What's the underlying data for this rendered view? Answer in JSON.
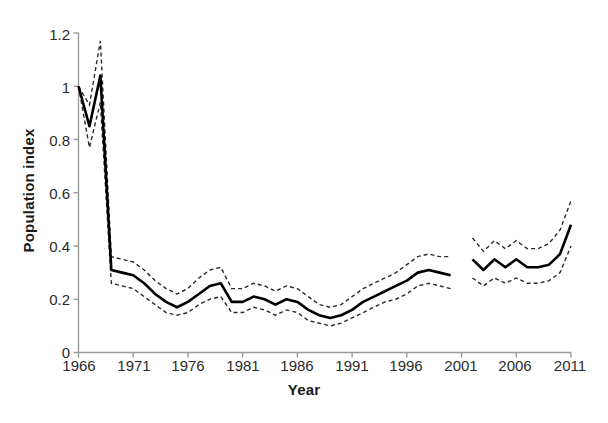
{
  "chart_data": {
    "type": "line",
    "title": "",
    "xlabel": "Year",
    "ylabel": "Population index",
    "xlim": [
      1966,
      2011
    ],
    "ylim": [
      0,
      1.2
    ],
    "xticks": [
      1966,
      1971,
      1976,
      1981,
      1986,
      1991,
      1996,
      2001,
      2006,
      2011
    ],
    "yticks": [
      "0",
      "0.2",
      "0.4",
      "0.6",
      "0.8",
      "1",
      "1.2"
    ],
    "ytick_values": [
      0,
      0.2,
      0.4,
      0.6,
      0.8,
      1.0,
      1.2
    ],
    "grid": false,
    "legend": "none",
    "x": [
      1966,
      1967,
      1968,
      1969,
      1970,
      1971,
      1972,
      1973,
      1974,
      1975,
      1976,
      1977,
      1978,
      1979,
      1980,
      1981,
      1982,
      1983,
      1984,
      1985,
      1986,
      1987,
      1988,
      1989,
      1990,
      1991,
      1992,
      1993,
      1994,
      1995,
      1996,
      1997,
      1998,
      1999,
      2000,
      2002,
      2003,
      2004,
      2005,
      2006,
      2007,
      2008,
      2009,
      2010,
      2011
    ],
    "series": [
      {
        "name": "Population index",
        "style": "solid",
        "values": [
          1.0,
          0.85,
          1.04,
          0.31,
          0.3,
          0.29,
          0.26,
          0.22,
          0.19,
          0.17,
          0.19,
          0.22,
          0.25,
          0.26,
          0.19,
          0.19,
          0.21,
          0.2,
          0.18,
          0.2,
          0.19,
          0.16,
          0.14,
          0.13,
          0.14,
          0.16,
          0.19,
          0.21,
          0.23,
          0.25,
          0.27,
          0.3,
          0.31,
          0.3,
          0.29,
          0.35,
          0.31,
          0.35,
          0.32,
          0.35,
          0.32,
          0.32,
          0.33,
          0.37,
          0.48
        ]
      },
      {
        "name": "Upper confidence limit",
        "style": "dashed",
        "values": [
          1.0,
          0.93,
          1.17,
          0.36,
          0.35,
          0.34,
          0.31,
          0.27,
          0.24,
          0.22,
          0.24,
          0.28,
          0.31,
          0.32,
          0.24,
          0.24,
          0.26,
          0.25,
          0.23,
          0.25,
          0.24,
          0.21,
          0.18,
          0.17,
          0.18,
          0.21,
          0.24,
          0.26,
          0.28,
          0.3,
          0.33,
          0.36,
          0.37,
          0.36,
          0.36,
          0.43,
          0.38,
          0.42,
          0.39,
          0.42,
          0.39,
          0.39,
          0.41,
          0.46,
          0.57
        ]
      },
      {
        "name": "Lower confidence limit",
        "style": "dashed",
        "values": [
          1.0,
          0.77,
          0.94,
          0.26,
          0.25,
          0.24,
          0.21,
          0.18,
          0.15,
          0.14,
          0.15,
          0.18,
          0.2,
          0.21,
          0.15,
          0.15,
          0.17,
          0.16,
          0.14,
          0.16,
          0.15,
          0.12,
          0.11,
          0.1,
          0.11,
          0.13,
          0.15,
          0.17,
          0.19,
          0.2,
          0.22,
          0.25,
          0.26,
          0.25,
          0.24,
          0.28,
          0.25,
          0.28,
          0.26,
          0.28,
          0.26,
          0.26,
          0.27,
          0.3,
          0.4
        ]
      }
    ],
    "gap_note": "No data plotted for 2001",
    "colors": {
      "line": "#000000",
      "confidence": "#333333",
      "axis": "#9a9a9a",
      "text": "#2b2b2b"
    }
  }
}
